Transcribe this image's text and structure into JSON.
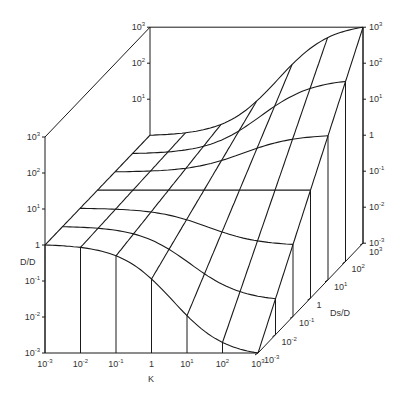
{
  "chart_data": {
    "type": "surface-3d",
    "title": "",
    "x_axis": {
      "label": "K",
      "ticks": [
        "10^-3",
        "10^-2",
        "10^-1",
        "1",
        "10^1",
        "10^2",
        "10^3"
      ]
    },
    "y_axis": {
      "label": "Ds/D",
      "ticks": [
        "10^-3",
        "10^-2",
        "10^-1",
        "1",
        "10^1",
        "10^2",
        "10^3"
      ]
    },
    "z_axis": {
      "label": "D'/D",
      "ticks": [
        "10^-3",
        "10^-2",
        "10^-1",
        "1",
        "10^1",
        "10^2",
        "10^3"
      ],
      "range_log10": [
        -3,
        3
      ]
    },
    "grid": "7x7 mesh",
    "surface_log10_rows_by_DsD": [
      {
        "DsD": "10^-3",
        "values": [
          0,
          0,
          -0.1,
          -0.9,
          -2.1,
          -2.8,
          -3
        ]
      },
      {
        "DsD": "10^-2",
        "values": [
          0,
          0,
          -0.07,
          -0.6,
          -1.4,
          -1.9,
          -2
        ]
      },
      {
        "DsD": "10^-1",
        "values": [
          0,
          0,
          -0.03,
          -0.3,
          -0.7,
          -0.95,
          -1
        ]
      },
      {
        "DsD": "1",
        "values": [
          0,
          0,
          0,
          0,
          0,
          0,
          0
        ]
      },
      {
        "DsD": "10^1",
        "values": [
          0,
          0,
          0.03,
          0.3,
          0.7,
          0.95,
          1
        ]
      },
      {
        "DsD": "10^2",
        "values": [
          0,
          0,
          0.07,
          0.6,
          1.4,
          1.9,
          2
        ]
      },
      {
        "DsD": "10^3",
        "values": [
          0,
          0,
          0.1,
          0.9,
          2.1,
          2.8,
          3
        ]
      }
    ]
  },
  "labels": {
    "z_title": "D/D",
    "x_title": "K",
    "y_title": "Ds/D"
  }
}
